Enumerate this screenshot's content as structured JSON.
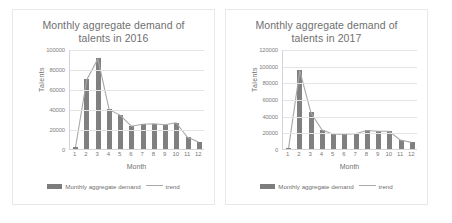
{
  "charts": [
    {
      "title_line1": "Monthly aggregate demand of",
      "title_line2": "talents in 2016",
      "ylabel": "Talents",
      "xlabel": "Month",
      "legend_bar": "Monthly aggregate demand",
      "legend_line": "trend",
      "bar_color": "#808080",
      "line_color": "#a8a8a8"
    },
    {
      "title_line1": "Monthly aggregate demand of",
      "title_line2": "talents in 2017",
      "ylabel": "Talents",
      "xlabel": "Month",
      "legend_bar": "Monthly aggregate demand",
      "legend_line": "trend",
      "bar_color": "#808080",
      "line_color": "#a8a8a8"
    }
  ],
  "chart_data": [
    {
      "type": "bar",
      "title": "Monthly aggregate demand of talents in 2016",
      "xlabel": "Month",
      "ylabel": "Talents",
      "categories": [
        "1",
        "2",
        "3",
        "4",
        "5",
        "6",
        "7",
        "8",
        "9",
        "10",
        "11",
        "12"
      ],
      "yticks": [
        0,
        20000,
        40000,
        60000,
        80000,
        100000
      ],
      "ylim": [
        0,
        100000
      ],
      "grid": true,
      "legend": [
        "Monthly aggregate demand",
        "trend"
      ],
      "legend_position": "bottom",
      "series": [
        {
          "name": "Monthly aggregate demand",
          "type": "bar",
          "values": [
            2000,
            70000,
            91000,
            40000,
            34000,
            23000,
            25000,
            25500,
            24500,
            26500,
            12000,
            7000
          ]
        },
        {
          "name": "trend",
          "type": "line",
          "values": [
            2000,
            70000,
            91000,
            40000,
            34000,
            23000,
            25000,
            25500,
            24500,
            26500,
            12000,
            7000
          ]
        }
      ]
    },
    {
      "type": "bar",
      "title": "Monthly aggregate demand of talents in 2017",
      "xlabel": "Month",
      "ylabel": "Talents",
      "categories": [
        "1",
        "2",
        "3",
        "4",
        "5",
        "6",
        "7",
        "8",
        "9",
        "10",
        "11",
        "12"
      ],
      "yticks": [
        0,
        20000,
        40000,
        60000,
        80000,
        100000,
        120000
      ],
      "ylim": [
        0,
        120000
      ],
      "grid": true,
      "legend": [
        "Monthly aggregate demand",
        "trend"
      ],
      "legend_position": "bottom",
      "series": [
        {
          "name": "Monthly aggregate demand",
          "type": "bar",
          "values": [
            1000,
            95000,
            44000,
            23000,
            18000,
            18000,
            18500,
            22500,
            21500,
            21500,
            11000,
            8000
          ]
        },
        {
          "name": "trend",
          "type": "line",
          "values": [
            1000,
            95000,
            44000,
            23000,
            18000,
            18000,
            18500,
            22500,
            21500,
            21500,
            11000,
            8000
          ]
        }
      ]
    }
  ]
}
